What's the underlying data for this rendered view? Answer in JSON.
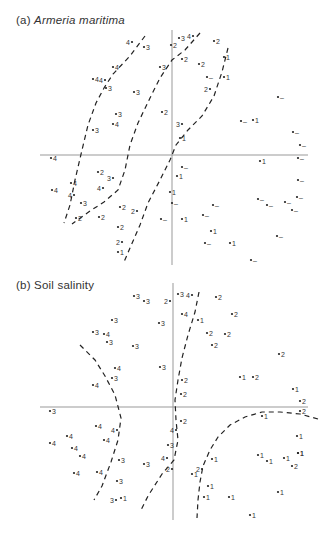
{
  "figure": {
    "panel_a": {
      "label": "(a)",
      "title": "Armeria maritima",
      "axes": {
        "x_y": 155,
        "x_from": 40,
        "x_to": 308,
        "y_x": 172,
        "y_from": 30,
        "y_to": 265
      },
      "points": [
        {
          "x": 132,
          "y": 42,
          "t": "4",
          "side": "left"
        },
        {
          "x": 144,
          "y": 47,
          "t": "3",
          "side": "right"
        },
        {
          "x": 113,
          "y": 67,
          "t": "4",
          "side": "right"
        },
        {
          "x": 93,
          "y": 79,
          "t": "4",
          "side": "right"
        },
        {
          "x": 105,
          "y": 80,
          "t": "4",
          "side": "left"
        },
        {
          "x": 106,
          "y": 88,
          "t": "3",
          "side": "right"
        },
        {
          "x": 134,
          "y": 92,
          "t": "3",
          "side": "right"
        },
        {
          "x": 116,
          "y": 114,
          "t": "3",
          "side": "right"
        },
        {
          "x": 113,
          "y": 124,
          "t": "4",
          "side": "right"
        },
        {
          "x": 93,
          "y": 130,
          "t": "3",
          "side": "right"
        },
        {
          "x": 160,
          "y": 67,
          "t": "3",
          "side": "right"
        },
        {
          "x": 162,
          "y": 112,
          "t": "2",
          "side": "right"
        },
        {
          "x": 171,
          "y": 45,
          "t": "2",
          "side": "right"
        },
        {
          "x": 179,
          "y": 38,
          "t": "3",
          "side": "right"
        },
        {
          "x": 193,
          "y": 36,
          "t": "4",
          "side": "left"
        },
        {
          "x": 214,
          "y": 41,
          "t": "2",
          "side": "right"
        },
        {
          "x": 182,
          "y": 59,
          "t": "2",
          "side": "right"
        },
        {
          "x": 199,
          "y": 64,
          "t": "2",
          "side": "right"
        },
        {
          "x": 207,
          "y": 77,
          "t": "–",
          "side": "right"
        },
        {
          "x": 210,
          "y": 89,
          "t": "2",
          "side": "left"
        },
        {
          "x": 224,
          "y": 57,
          "t": "1",
          "side": "right"
        },
        {
          "x": 224,
          "y": 77,
          "t": "1",
          "side": "right"
        },
        {
          "x": 278,
          "y": 97,
          "t": "–",
          "side": "right"
        },
        {
          "x": 241,
          "y": 121,
          "t": "–",
          "side": "right"
        },
        {
          "x": 253,
          "y": 120,
          "t": "1",
          "side": "right"
        },
        {
          "x": 293,
          "y": 132,
          "t": "–",
          "side": "right"
        },
        {
          "x": 182,
          "y": 124,
          "t": "3",
          "side": "left"
        },
        {
          "x": 180,
          "y": 138,
          "t": "1",
          "side": "right"
        },
        {
          "x": 300,
          "y": 145,
          "t": "–",
          "side": "right"
        },
        {
          "x": 298,
          "y": 158,
          "t": "–",
          "side": "right"
        },
        {
          "x": 260,
          "y": 161,
          "t": "1",
          "side": "right"
        },
        {
          "x": 182,
          "y": 167,
          "t": "–",
          "side": "right"
        },
        {
          "x": 177,
          "y": 176,
          "t": "1",
          "side": "right"
        },
        {
          "x": 298,
          "y": 180,
          "t": "–",
          "side": "right"
        },
        {
          "x": 170,
          "y": 192,
          "t": "1",
          "side": "right"
        },
        {
          "x": 172,
          "y": 203,
          "t": "–",
          "side": "right"
        },
        {
          "x": 258,
          "y": 199,
          "t": "–",
          "side": "right"
        },
        {
          "x": 267,
          "y": 205,
          "t": "–",
          "side": "right"
        },
        {
          "x": 285,
          "y": 202,
          "t": "–",
          "side": "right"
        },
        {
          "x": 297,
          "y": 197,
          "t": "–",
          "side": "right"
        },
        {
          "x": 292,
          "y": 210,
          "t": "–",
          "side": "right"
        },
        {
          "x": 213,
          "y": 205,
          "t": "–",
          "side": "right"
        },
        {
          "x": 203,
          "y": 215,
          "t": "–",
          "side": "right"
        },
        {
          "x": 161,
          "y": 219,
          "t": "–",
          "side": "right"
        },
        {
          "x": 182,
          "y": 219,
          "t": "1",
          "side": "right"
        },
        {
          "x": 211,
          "y": 231,
          "t": "1",
          "side": "right"
        },
        {
          "x": 205,
          "y": 243,
          "t": "–",
          "side": "right"
        },
        {
          "x": 230,
          "y": 243,
          "t": "1",
          "side": "right"
        },
        {
          "x": 277,
          "y": 236,
          "t": "–",
          "side": "right"
        },
        {
          "x": 251,
          "y": 260,
          "t": "–",
          "side": "right"
        },
        {
          "x": 51,
          "y": 158,
          "t": "4",
          "side": "right"
        },
        {
          "x": 98,
          "y": 172,
          "t": "2",
          "side": "right"
        },
        {
          "x": 71,
          "y": 183,
          "t": "4",
          "side": "right"
        },
        {
          "x": 113,
          "y": 178,
          "t": "3",
          "side": "left"
        },
        {
          "x": 103,
          "y": 188,
          "t": "4",
          "side": "left"
        },
        {
          "x": 52,
          "y": 190,
          "t": "4",
          "side": "right"
        },
        {
          "x": 74,
          "y": 195,
          "t": "4",
          "side": "left"
        },
        {
          "x": 81,
          "y": 203,
          "t": "3",
          "side": "right"
        },
        {
          "x": 120,
          "y": 207,
          "t": "2",
          "side": "right"
        },
        {
          "x": 76,
          "y": 218,
          "t": "2",
          "side": "right"
        },
        {
          "x": 99,
          "y": 217,
          "t": "2",
          "side": "right"
        },
        {
          "x": 137,
          "y": 211,
          "t": "2",
          "side": "left"
        },
        {
          "x": 118,
          "y": 227,
          "t": "2",
          "side": "right"
        },
        {
          "x": 118,
          "y": 252,
          "t": "1",
          "side": "right"
        },
        {
          "x": 122,
          "y": 242,
          "t": "2",
          "side": "left"
        }
      ],
      "boundaries": [
        "M145,36 L130,56 L113,74 L104,88 L96,103 L88,125 L82,150 L75,180 L70,205 L64,223",
        "M200,33 L185,50 L172,60 L160,78 L150,98 L138,123 L130,145 L125,170 L118,190 L104,202 L90,211 L72,224",
        "M228,48 L222,72 L214,96 L202,116 L188,130 L176,145 L170,160 L160,180 L148,203 L140,225 L130,248 L124,262"
      ]
    },
    "panel_b": {
      "label": "(b)",
      "title": "Soil salinity",
      "axes": {
        "x_y": 407,
        "x_from": 40,
        "x_to": 308,
        "y_x": 173,
        "y_from": 283,
        "y_to": 520
      },
      "points": [
        {
          "x": 134,
          "y": 296,
          "t": "3",
          "side": "right"
        },
        {
          "x": 144,
          "y": 301,
          "t": "3",
          "side": "right"
        },
        {
          "x": 170,
          "y": 301,
          "t": "2",
          "side": "left"
        },
        {
          "x": 178,
          "y": 294,
          "t": "3",
          "side": "right"
        },
        {
          "x": 192,
          "y": 295,
          "t": "4",
          "side": "left"
        },
        {
          "x": 216,
          "y": 297,
          "t": "2",
          "side": "right"
        },
        {
          "x": 112,
          "y": 320,
          "t": "3",
          "side": "right"
        },
        {
          "x": 159,
          "y": 323,
          "t": "3",
          "side": "right"
        },
        {
          "x": 182,
          "y": 314,
          "t": "4",
          "side": "right"
        },
        {
          "x": 198,
          "y": 320,
          "t": "1",
          "side": "right"
        },
        {
          "x": 232,
          "y": 314,
          "t": "2",
          "side": "right"
        },
        {
          "x": 93,
          "y": 332,
          "t": "3",
          "side": "right"
        },
        {
          "x": 104,
          "y": 334,
          "t": "4",
          "side": "right"
        },
        {
          "x": 107,
          "y": 342,
          "t": "3",
          "side": "right"
        },
        {
          "x": 207,
          "y": 333,
          "t": "2",
          "side": "right"
        },
        {
          "x": 225,
          "y": 334,
          "t": "2",
          "side": "right"
        },
        {
          "x": 133,
          "y": 346,
          "t": "3",
          "side": "right"
        },
        {
          "x": 212,
          "y": 345,
          "t": "2",
          "side": "right"
        },
        {
          "x": 279,
          "y": 354,
          "t": "2",
          "side": "right"
        },
        {
          "x": 115,
          "y": 368,
          "t": "4",
          "side": "right"
        },
        {
          "x": 160,
          "y": 367,
          "t": "3",
          "side": "right"
        },
        {
          "x": 112,
          "y": 378,
          "t": "3",
          "side": "right"
        },
        {
          "x": 93,
          "y": 385,
          "t": "4",
          "side": "right"
        },
        {
          "x": 182,
          "y": 380,
          "t": "2",
          "side": "right"
        },
        {
          "x": 240,
          "y": 377,
          "t": "1",
          "side": "right"
        },
        {
          "x": 253,
          "y": 377,
          "t": "2",
          "side": "right"
        },
        {
          "x": 181,
          "y": 394,
          "t": "2",
          "side": "right"
        },
        {
          "x": 293,
          "y": 389,
          "t": "1",
          "side": "right"
        },
        {
          "x": 300,
          "y": 401,
          "t": "2",
          "side": "right"
        },
        {
          "x": 50,
          "y": 411,
          "t": "3",
          "side": "right"
        },
        {
          "x": 300,
          "y": 411,
          "t": "2",
          "side": "right"
        },
        {
          "x": 262,
          "y": 416,
          "t": "1",
          "side": "right"
        },
        {
          "x": 181,
          "y": 421,
          "t": "2",
          "side": "right"
        },
        {
          "x": 96,
          "y": 426,
          "t": "4",
          "side": "right"
        },
        {
          "x": 117,
          "y": 430,
          "t": "4",
          "side": "left"
        },
        {
          "x": 176,
          "y": 430,
          "t": "4",
          "side": "left"
        },
        {
          "x": 67,
          "y": 436,
          "t": "4",
          "side": "right"
        },
        {
          "x": 104,
          "y": 440,
          "t": "4",
          "side": "right"
        },
        {
          "x": 297,
          "y": 436,
          "t": "1",
          "side": "right"
        },
        {
          "x": 50,
          "y": 443,
          "t": "4",
          "side": "right"
        },
        {
          "x": 72,
          "y": 448,
          "t": "4",
          "side": "right"
        },
        {
          "x": 168,
          "y": 445,
          "t": "3",
          "side": "right"
        },
        {
          "x": 298,
          "y": 453,
          "t": "1",
          "side": "right"
        },
        {
          "x": 80,
          "y": 456,
          "t": "4",
          "side": "right"
        },
        {
          "x": 119,
          "y": 460,
          "t": "3",
          "side": "right"
        },
        {
          "x": 144,
          "y": 464,
          "t": "3",
          "side": "right"
        },
        {
          "x": 167,
          "y": 458,
          "t": "4",
          "side": "left"
        },
        {
          "x": 172,
          "y": 469,
          "t": "2",
          "side": "left"
        },
        {
          "x": 212,
          "y": 459,
          "t": "1",
          "side": "right"
        },
        {
          "x": 258,
          "y": 455,
          "t": "1",
          "side": "right"
        },
        {
          "x": 267,
          "y": 461,
          "t": "1",
          "side": "right"
        },
        {
          "x": 284,
          "y": 458,
          "t": "1",
          "side": "right"
        },
        {
          "x": 298,
          "y": 453,
          "t": "1",
          "side": "right"
        },
        {
          "x": 292,
          "y": 466,
          "t": "2",
          "side": "right"
        },
        {
          "x": 74,
          "y": 473,
          "t": "4",
          "side": "right"
        },
        {
          "x": 97,
          "y": 472,
          "t": "4",
          "side": "right"
        },
        {
          "x": 117,
          "y": 481,
          "t": "3",
          "side": "right"
        },
        {
          "x": 192,
          "y": 474,
          "t": "1",
          "side": "right"
        },
        {
          "x": 202,
          "y": 469,
          "t": "2",
          "side": "left"
        },
        {
          "x": 208,
          "y": 486,
          "t": "1",
          "side": "right"
        },
        {
          "x": 278,
          "y": 492,
          "t": "1",
          "side": "right"
        },
        {
          "x": 116,
          "y": 500,
          "t": "3",
          "side": "left"
        },
        {
          "x": 121,
          "y": 498,
          "t": "1",
          "side": "right"
        },
        {
          "x": 204,
          "y": 497,
          "t": "1",
          "side": "right"
        },
        {
          "x": 229,
          "y": 497,
          "t": "1",
          "side": "right"
        },
        {
          "x": 250,
          "y": 515,
          "t": "1",
          "side": "right"
        }
      ],
      "boundaries": [
        "M80,345 L95,360 L105,376 L115,395 L121,418 L118,440 L111,462 L102,486 L94,500",
        "M199,292 L195,312 L188,335 L182,358 L178,380 L175,400 L176,420 L178,440 L174,460 L162,474 L148,496 L140,512",
        "M318,419 L300,414 L280,412 L262,412 L245,417 L230,425 L218,437 L210,450 L203,466 L200,482 L198,500 L197,518"
      ]
    }
  }
}
